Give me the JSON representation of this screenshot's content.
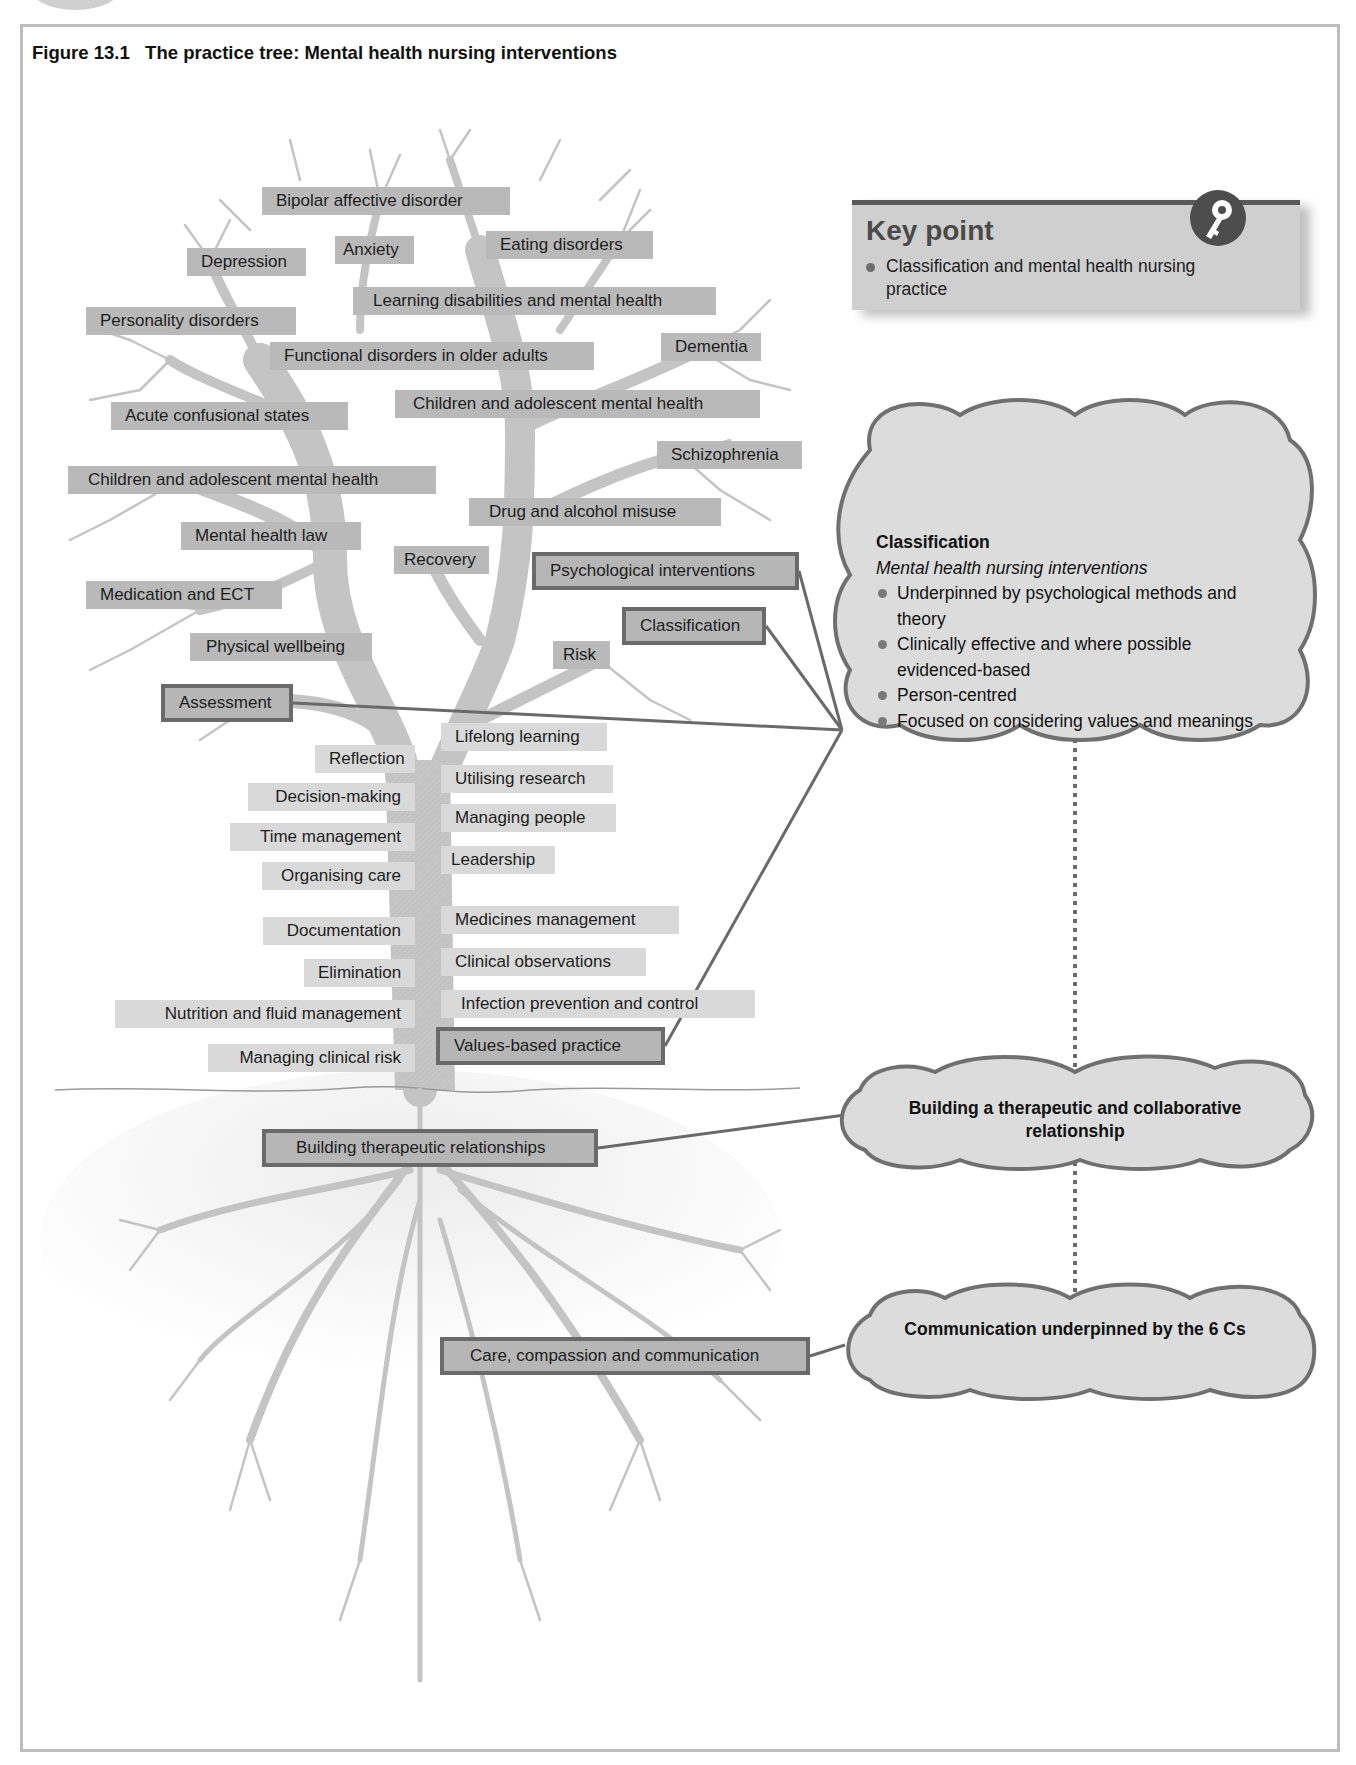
{
  "figure": {
    "title": "Figure 13.1   The practice tree: Mental health nursing interventions"
  },
  "key_point": {
    "title": "Key point",
    "icon": "key-icon",
    "items": [
      "Classification and mental health nursing practice"
    ]
  },
  "canopy_labels": [
    {
      "text": "Bipolar affective disorder"
    },
    {
      "text": "Depression"
    },
    {
      "text": "Anxiety"
    },
    {
      "text": "Eating disorders"
    },
    {
      "text": "Learning disabilities and mental health"
    },
    {
      "text": "Personality disorders"
    },
    {
      "text": "Functional disorders in older adults"
    },
    {
      "text": "Dementia"
    },
    {
      "text": "Acute confusional states"
    },
    {
      "text": "Children and adolescent mental health"
    },
    {
      "text": "Schizophrenia"
    },
    {
      "text": "Children and adolescent mental health"
    },
    {
      "text": "Drug and alcohol misuse"
    },
    {
      "text": "Mental health law"
    },
    {
      "text": "Recovery"
    },
    {
      "text": "Psychological interventions",
      "highlighted": true
    },
    {
      "text": "Medication and ECT"
    },
    {
      "text": "Classification",
      "highlighted": true
    },
    {
      "text": "Physical wellbeing"
    },
    {
      "text": "Risk"
    },
    {
      "text": "Assessment",
      "highlighted": true
    }
  ],
  "trunk_left_labels": [
    {
      "text": "Reflection"
    },
    {
      "text": "Decision-making"
    },
    {
      "text": "Time management"
    },
    {
      "text": "Organising care"
    },
    {
      "text": "Documentation"
    },
    {
      "text": "Elimination"
    },
    {
      "text": "Nutrition and fluid management"
    },
    {
      "text": "Managing clinical risk"
    }
  ],
  "trunk_right_labels": [
    {
      "text": "Lifelong learning"
    },
    {
      "text": "Utilising research"
    },
    {
      "text": "Managing people"
    },
    {
      "text": "Leadership"
    },
    {
      "text": "Medicines management"
    },
    {
      "text": "Clinical observations"
    },
    {
      "text": "Infection prevention and control"
    },
    {
      "text": "Values-based practice",
      "highlighted": true
    }
  ],
  "root_labels": [
    {
      "text": "Building therapeutic relationships",
      "highlighted": true
    },
    {
      "text": "Care, compassion and communication",
      "highlighted": true
    }
  ],
  "clouds": {
    "classification": {
      "heading": "Classification",
      "subheading": "Mental health nursing interventions",
      "bullets": [
        "Underpinned by psychological methods and theory",
        "Clinically effective and where possible evidenced-based",
        "Person-centred",
        "Focused on considering values and meanings"
      ]
    },
    "relationship": {
      "text": "Building a therapeutic and collaborative relationship"
    },
    "communication": {
      "text": "Communication underpinned by the 6 Cs"
    }
  },
  "colors": {
    "label_fill": "#b9b9b9",
    "label_light_fill": "#d9d9d9",
    "highlight_border": "#6a6a6a",
    "tree_fill": "#c4c4c4",
    "cloud_fill": "#dcdcdc",
    "cloud_stroke": "#707070",
    "keypoint_fill": "#cfcfcf",
    "keypoint_bar": "#5a5a5a"
  }
}
